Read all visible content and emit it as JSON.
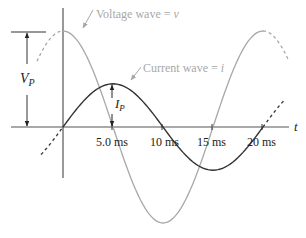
{
  "diagram": {
    "labels": {
      "voltage_wave": "Voltage wave = ",
      "voltage_symbol": "v",
      "current_wave": "Current wave = ",
      "current_symbol": "i",
      "axis_t": "t",
      "vp_main": "V",
      "vp_sub": "P",
      "ip_main": "I",
      "ip_sub": "P"
    },
    "time_ticks": [
      "5.0 ms",
      "10 ms",
      "15 ms",
      "20 ms"
    ],
    "waves": {
      "voltage": {
        "type": "cosine",
        "period_ms": 20,
        "relative_amplitude": 1.0,
        "color": "#a8a8a8"
      },
      "current": {
        "type": "sine",
        "period_ms": 20,
        "relative_amplitude": 0.45,
        "color": "#333333"
      }
    },
    "colors": {
      "axis": "#555555",
      "voltage": "#a8a8a8",
      "current": "#333333",
      "annotation": "#222222"
    }
  }
}
